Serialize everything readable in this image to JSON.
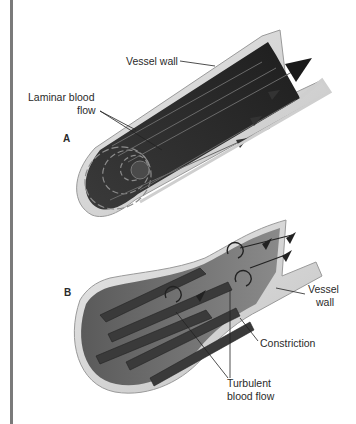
{
  "figure": {
    "panels": [
      {
        "id": "A",
        "letter": "A",
        "title": "Laminar flow",
        "labels": {
          "vessel_wall": "Vessel wall",
          "flow_line1": "Laminar blood",
          "flow_line2": "flow"
        }
      },
      {
        "id": "B",
        "letter": "B",
        "title": "Turbulent flow",
        "labels": {
          "vessel_wall_line1": "Vessel",
          "vessel_wall_line2": "wall",
          "constriction": "Constriction",
          "flow_line1": "Turbulent",
          "flow_line2": "blood flow"
        }
      }
    ],
    "colors": {
      "background": "#ffffff",
      "rule": "#7a7a7a",
      "wall_outer": "#d8d8d8",
      "wall_inner": "#b8b8b8",
      "lumen": "#6e6e6e",
      "stream_dark": "#2b2b2b",
      "stream_light": "#555555",
      "text": "#2a2a2a"
    }
  }
}
